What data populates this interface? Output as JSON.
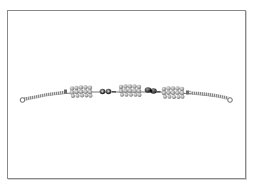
{
  "image": {
    "subject": "beaded bracelet with coiled wire ends",
    "top_caption": "",
    "colors": {
      "frame": "#8a8a8a",
      "background": "#ffffff",
      "bead_light": "#b8b8b8",
      "bead_mid": "#8c8c8c",
      "bead_dark": "#3a3a3a",
      "wire": "#7a7a7a"
    },
    "components": [
      {
        "name": "left-end-loop"
      },
      {
        "name": "left-coil"
      },
      {
        "name": "bead-cluster-1"
      },
      {
        "name": "small-dark-bead-pair"
      },
      {
        "name": "bead-cluster-2"
      },
      {
        "name": "dark-clasp"
      },
      {
        "name": "bead-cluster-3"
      },
      {
        "name": "right-coil"
      },
      {
        "name": "right-end-loop"
      }
    ]
  }
}
